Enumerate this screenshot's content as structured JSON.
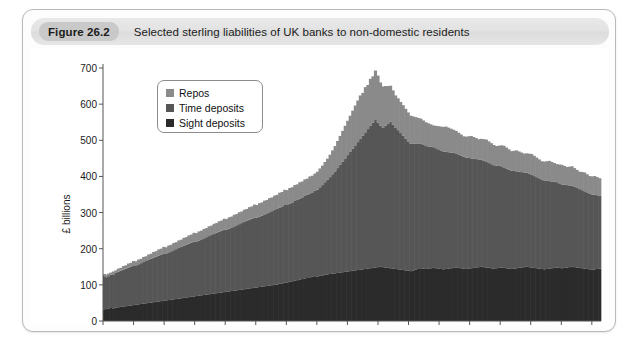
{
  "figure": {
    "badge": "Figure 26.2",
    "title": "Selected sterling liabilities of UK banks to non-domestic residents"
  },
  "legend": {
    "items": [
      {
        "label": "Repos",
        "color": "#8a8a8a"
      },
      {
        "label": "Time deposits",
        "color": "#565656"
      },
      {
        "label": "Sight deposits",
        "color": "#2b2b2b"
      }
    ]
  },
  "chart_data": {
    "type": "area",
    "stacked": true,
    "title": "Selected sterling liabilities of UK banks to non-domestic residents",
    "xlabel": "",
    "ylabel": "£ billions",
    "ylim": [
      0,
      700
    ],
    "xlim": [
      1998,
      2014.3
    ],
    "grid": false,
    "legend_position": "upper-left-inside",
    "ytick_labels": [
      "0",
      "100",
      "200",
      "300",
      "400",
      "500",
      "600",
      "700"
    ],
    "ytick_values": [
      0,
      100,
      200,
      300,
      400,
      500,
      600,
      700
    ],
    "xtick_labels": [
      "1998",
      "2000",
      "2002",
      "2004",
      "2006",
      "2008",
      "2010",
      "2012",
      "2014"
    ],
    "xtick_values": [
      1998,
      2000,
      2002,
      2004,
      2006,
      2008,
      2010,
      2012,
      2014
    ],
    "x_minor_step": 1,
    "series": [
      {
        "name": "Sight deposits",
        "color": "#2b2b2b",
        "values": [
          32,
          33,
          34,
          36,
          35,
          37,
          38,
          39,
          40,
          41,
          42,
          43,
          44,
          45,
          46,
          47,
          48,
          49,
          50,
          51,
          52,
          53,
          54,
          55,
          56,
          57,
          58,
          59,
          60,
          61,
          62,
          63,
          64,
          65,
          66,
          67,
          68,
          69,
          70,
          71,
          72,
          73,
          74,
          75,
          76,
          77,
          78,
          79,
          80,
          81,
          82,
          83,
          84,
          85,
          86,
          87,
          88,
          89,
          90,
          91,
          92,
          93,
          94,
          95,
          96,
          97,
          98,
          99,
          100,
          101,
          103,
          104,
          106,
          107,
          109,
          110,
          112,
          113,
          115,
          116,
          118,
          119,
          121,
          122,
          124,
          123,
          125,
          126,
          128,
          129,
          130,
          131,
          132,
          133,
          134,
          135,
          136,
          137,
          138,
          139,
          140,
          141,
          142,
          143,
          144,
          145,
          146,
          147,
          148,
          149,
          150,
          149,
          148,
          147,
          146,
          145,
          144,
          143,
          142,
          141,
          140,
          139,
          138,
          140,
          142,
          144,
          146,
          145,
          144,
          145,
          146,
          147,
          146,
          145,
          144,
          143,
          144,
          145,
          146,
          147,
          148,
          147,
          146,
          145,
          144,
          145,
          146,
          147,
          148,
          149,
          150,
          149,
          148,
          147,
          146,
          145,
          146,
          147,
          148,
          147,
          146,
          145,
          144,
          145,
          146,
          147,
          148,
          149,
          150,
          149,
          148,
          147,
          146,
          145,
          144,
          143,
          144,
          145,
          146,
          147,
          148,
          147,
          146,
          147,
          148,
          149,
          150,
          149,
          148,
          147,
          146,
          145,
          144,
          143,
          142,
          143,
          144,
          145
        ]
      },
      {
        "name": "Time deposits",
        "color": "#565656",
        "values": [
          93,
          88,
          90,
          92,
          94,
          96,
          98,
          100,
          102,
          104,
          106,
          108,
          110,
          109,
          111,
          113,
          115,
          117,
          119,
          121,
          123,
          125,
          127,
          129,
          131,
          130,
          132,
          134,
          136,
          138,
          140,
          142,
          144,
          146,
          148,
          150,
          152,
          151,
          153,
          155,
          157,
          159,
          161,
          163,
          165,
          167,
          169,
          171,
          173,
          172,
          174,
          176,
          178,
          180,
          182,
          184,
          186,
          188,
          190,
          192,
          194,
          193,
          195,
          197,
          199,
          201,
          203,
          205,
          207,
          209,
          211,
          213,
          215,
          214,
          216,
          218,
          220,
          222,
          224,
          226,
          228,
          230,
          232,
          234,
          236,
          240,
          245,
          250,
          256,
          262,
          268,
          275,
          282,
          290,
          298,
          306,
          314,
          322,
          330,
          338,
          346,
          354,
          362,
          370,
          378,
          386,
          394,
          402,
          410,
          400,
          390,
          385,
          392,
          398,
          405,
          398,
          390,
          385,
          378,
          372,
          365,
          358,
          352,
          350,
          348,
          346,
          344,
          342,
          340,
          338,
          336,
          334,
          332,
          330,
          328,
          326,
          324,
          322,
          320,
          318,
          316,
          314,
          312,
          310,
          308,
          306,
          304,
          302,
          300,
          298,
          296,
          294,
          292,
          290,
          288,
          286,
          284,
          282,
          280,
          278,
          276,
          274,
          272,
          270,
          268,
          266,
          264,
          262,
          260,
          258,
          256,
          254,
          252,
          250,
          248,
          246,
          244,
          242,
          240,
          238,
          236,
          234,
          232,
          230,
          228,
          226,
          224,
          222,
          220,
          218,
          216,
          214,
          212,
          210,
          208,
          206,
          204,
          202
        ]
      },
      {
        "name": "Repos",
        "color": "#8a8a8a",
        "values": [
          5,
          6,
          7,
          6,
          8,
          7,
          9,
          8,
          10,
          9,
          11,
          10,
          12,
          11,
          13,
          12,
          14,
          13,
          15,
          14,
          16,
          15,
          17,
          16,
          18,
          17,
          19,
          18,
          20,
          19,
          21,
          20,
          22,
          21,
          23,
          22,
          24,
          23,
          25,
          24,
          26,
          25,
          27,
          26,
          28,
          27,
          29,
          28,
          30,
          29,
          31,
          30,
          32,
          31,
          33,
          32,
          34,
          33,
          35,
          34,
          36,
          35,
          37,
          36,
          38,
          37,
          39,
          38,
          40,
          39,
          41,
          40,
          42,
          41,
          43,
          42,
          44,
          43,
          45,
          44,
          46,
          45,
          47,
          46,
          48,
          50,
          52,
          54,
          56,
          58,
          62,
          66,
          70,
          75,
          80,
          85,
          90,
          95,
          100,
          105,
          110,
          115,
          120,
          118,
          125,
          122,
          130,
          128,
          135,
          130,
          120,
          115,
          110,
          105,
          100,
          95,
          90,
          88,
          86,
          84,
          82,
          80,
          78,
          76,
          74,
          72,
          70,
          68,
          66,
          64,
          62,
          60,
          62,
          64,
          66,
          68,
          70,
          68,
          66,
          64,
          62,
          60,
          58,
          56,
          58,
          60,
          62,
          60,
          58,
          56,
          58,
          60,
          62,
          60,
          58,
          56,
          54,
          56,
          58,
          60,
          58,
          56,
          54,
          56,
          58,
          56,
          54,
          52,
          54,
          56,
          58,
          56,
          54,
          52,
          50,
          52,
          54,
          56,
          54,
          52,
          50,
          52,
          54,
          52,
          50,
          52,
          54,
          52,
          50,
          48,
          50,
          52,
          50,
          48,
          50,
          52,
          50,
          48
        ]
      }
    ],
    "peak_total_approx": 630,
    "peak_year_approx": 2008
  }
}
